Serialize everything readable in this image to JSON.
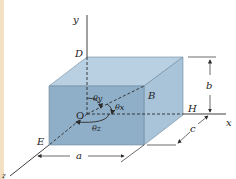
{
  "diagram": {
    "type": "3D rectangular box with direction angles",
    "colors": {
      "top_face": "#b9d0e2",
      "front_face": "#8fafc8",
      "right_face": "#a9c3d8",
      "line": "#2b2b2b",
      "background": "#ffffff",
      "left_strip": "#f3dfc2"
    },
    "axes": {
      "x": "x",
      "y": "y",
      "z": "z"
    },
    "points": {
      "D": "D",
      "B": "B",
      "O": "O",
      "H": "H",
      "E": "E"
    },
    "angles": {
      "theta_x": "θx",
      "theta_y": "θy",
      "theta_z": "θz"
    },
    "dimensions": {
      "a": "a",
      "b": "b",
      "c": "c"
    }
  }
}
